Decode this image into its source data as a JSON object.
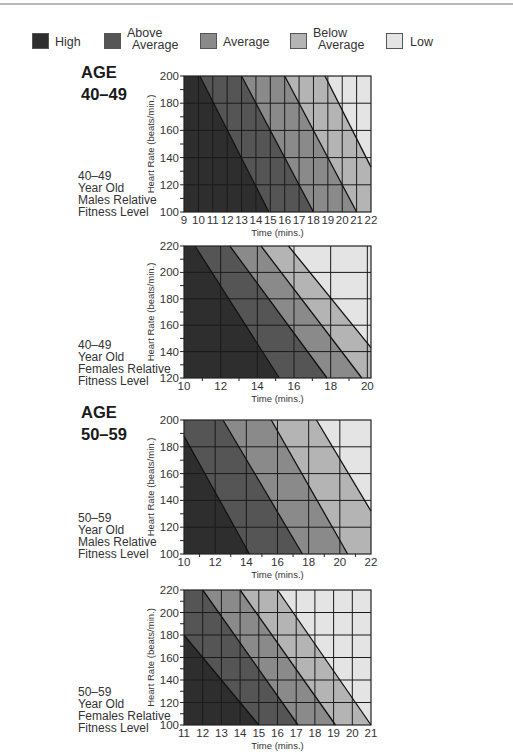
{
  "legend": {
    "items": [
      {
        "key": "high",
        "label_lines": [
          "High"
        ],
        "color": "#2e2e2e"
      },
      {
        "key": "above_average",
        "label_lines": [
          "Above",
          "Average"
        ],
        "color": "#555555"
      },
      {
        "key": "average",
        "label_lines": [
          "Average"
        ],
        "color": "#8a8a8a"
      },
      {
        "key": "below_average",
        "label_lines": [
          "Below",
          "Average"
        ],
        "color": "#b4b4b4"
      },
      {
        "key": "low",
        "label_lines": [
          "Low"
        ],
        "color": "#e4e4e4"
      }
    ]
  },
  "sections": [
    {
      "age_label": "AGE",
      "age_range": "40–49"
    },
    {
      "age_label": "AGE",
      "age_range": "50–59"
    }
  ],
  "charts": [
    {
      "side_label": [
        "40–49",
        "Year Old",
        "Males Relative",
        "Fitness Level"
      ]
    },
    {
      "side_label": [
        "40–49",
        "Year Old",
        "Females Relative",
        "Fitness Level"
      ]
    },
    {
      "side_label": [
        "50–59",
        "Year Old",
        "Males Relative",
        "Fitness Level"
      ]
    },
    {
      "side_label": [
        "50–59",
        "Year Old",
        "Females Relative",
        "Fitness Level"
      ]
    }
  ],
  "chart_data": [
    {
      "type": "area",
      "title": "40–49 Year Old Males Relative Fitness Level",
      "xlabel": "Time (mins.)",
      "ylabel": "Heart Rate (beats/min.)",
      "xlim": [
        9,
        22
      ],
      "ylim": [
        100,
        200
      ],
      "xticks": [
        9,
        10,
        11,
        12,
        13,
        14,
        15,
        16,
        17,
        18,
        19,
        20,
        21,
        22
      ],
      "yticks": [
        100,
        120,
        140,
        160,
        180,
        200
      ],
      "grid": true,
      "boundaries": [
        {
          "between": [
            "High",
            "Above Average"
          ],
          "points": [
            [
              10.1,
              200
            ],
            [
              14.9,
              100
            ]
          ]
        },
        {
          "between": [
            "Above Average",
            "Average"
          ],
          "points": [
            [
              13,
              200
            ],
            [
              18,
              100
            ]
          ]
        },
        {
          "between": [
            "Average",
            "Below Average"
          ],
          "points": [
            [
              16,
              200
            ],
            [
              21,
              100
            ]
          ]
        },
        {
          "between": [
            "Below Average",
            "Low"
          ],
          "points": [
            [
              18.8,
              200
            ],
            [
              22,
              133
            ]
          ]
        }
      ]
    },
    {
      "type": "area",
      "title": "40–49 Year Old Females Relative Fitness Level",
      "xlabel": "Time (mins.)",
      "ylabel": "Heart Rate (beats/min.)",
      "xlim": [
        10,
        20.2
      ],
      "ylim": [
        120,
        220
      ],
      "xticks": [
        10,
        12,
        14,
        16,
        18,
        20
      ],
      "yticks": [
        120,
        140,
        160,
        180,
        200,
        220
      ],
      "grid": true,
      "boundaries": [
        {
          "between": [
            "High",
            "Above Average"
          ],
          "points": [
            [
              10.6,
              220
            ],
            [
              15.2,
              120
            ]
          ]
        },
        {
          "between": [
            "Above Average",
            "Average"
          ],
          "points": [
            [
              12.5,
              220
            ],
            [
              17.8,
              120
            ]
          ]
        },
        {
          "between": [
            "Average",
            "Below Average"
          ],
          "points": [
            [
              14.2,
              220
            ],
            [
              19.7,
              120
            ]
          ]
        },
        {
          "between": [
            "Below Average",
            "Low"
          ],
          "points": [
            [
              15.7,
              220
            ],
            [
              20.2,
              143
            ]
          ]
        }
      ]
    },
    {
      "type": "area",
      "title": "50–59 Year Old Males Relative Fitness Level",
      "xlabel": "Time (mins.)",
      "ylabel": "Heart Rate (beats/min.)",
      "xlim": [
        10,
        22
      ],
      "ylim": [
        100,
        200
      ],
      "xticks": [
        10,
        12,
        14,
        16,
        18,
        20,
        22
      ],
      "yticks": [
        100,
        120,
        140,
        160,
        180,
        200
      ],
      "grid": true,
      "boundaries": [
        {
          "between": [
            "High",
            "Above Average"
          ],
          "points": [
            [
              10,
              188
            ],
            [
              14.2,
              100
            ]
          ]
        },
        {
          "between": [
            "Above Average",
            "Average"
          ],
          "points": [
            [
              12.5,
              200
            ],
            [
              17.6,
              100
            ]
          ]
        },
        {
          "between": [
            "Average",
            "Below Average"
          ],
          "points": [
            [
              15.6,
              200
            ],
            [
              20.5,
              100
            ]
          ]
        },
        {
          "between": [
            "Below Average",
            "Low"
          ],
          "points": [
            [
              18.5,
              200
            ],
            [
              22,
              132
            ]
          ]
        }
      ]
    },
    {
      "type": "area",
      "title": "50–59 Year Old Females Relative Fitness Level",
      "xlabel": "Time (mins.)",
      "ylabel": "Heart Rate (beats/min.)",
      "xlim": [
        11,
        21
      ],
      "ylim": [
        100,
        220
      ],
      "xticks": [
        11,
        12,
        13,
        14,
        15,
        16,
        17,
        18,
        19,
        20,
        21
      ],
      "yticks": [
        100,
        120,
        140,
        160,
        180,
        200,
        220
      ],
      "grid": true,
      "boundaries": [
        {
          "between": [
            "High",
            "Above Average"
          ],
          "points": [
            [
              11,
              180
            ],
            [
              15,
              100
            ]
          ]
        },
        {
          "between": [
            "Above Average",
            "Average"
          ],
          "points": [
            [
              12,
              220
            ],
            [
              17.1,
              100
            ]
          ]
        },
        {
          "between": [
            "Average",
            "Below Average"
          ],
          "points": [
            [
              14,
              220
            ],
            [
              19.1,
              100
            ]
          ]
        },
        {
          "between": [
            "Below Average",
            "Low"
          ],
          "points": [
            [
              16,
              220
            ],
            [
              21,
              100
            ]
          ]
        }
      ]
    }
  ]
}
